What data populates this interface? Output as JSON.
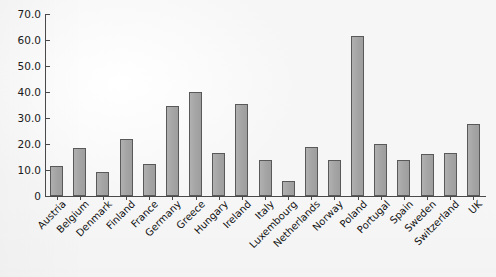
{
  "chart_data": {
    "type": "bar",
    "title": "",
    "subtitle": "",
    "xlabel": "",
    "ylabel": "",
    "ylim": [
      0,
      70
    ],
    "yticks": [
      "0",
      "10.0",
      "20.0",
      "30.0",
      "40.0",
      "50.0",
      "60.0",
      "70.0"
    ],
    "ytick_values": [
      0,
      10,
      20,
      30,
      40,
      50,
      60,
      70
    ],
    "grid": false,
    "legend": null,
    "bar_color": "#a6a6a6",
    "bar_edge_color": "#595959",
    "axis_color": "#4a4a4a",
    "background_color": "#f7f7f7",
    "categories": [
      "Austria",
      "Belgium",
      "Denmark",
      "Finland",
      "France",
      "Germany",
      "Greece",
      "Hungary",
      "Ireland",
      "Italy",
      "Luxembourg",
      "Netherlands",
      "Norway",
      "Poland",
      "Portugal",
      "Spain",
      "Sweden",
      "Switzerland",
      "UK"
    ],
    "values": [
      11.5,
      18.5,
      9.3,
      21.8,
      12.3,
      34.5,
      40.0,
      16.6,
      35.3,
      13.7,
      5.6,
      18.8,
      13.7,
      61.5,
      20.0,
      13.8,
      16.1,
      16.5,
      27.8
    ]
  }
}
